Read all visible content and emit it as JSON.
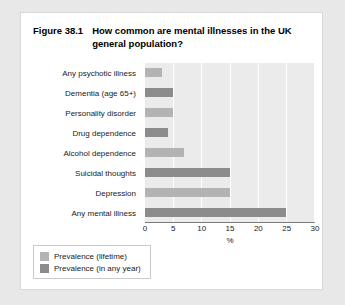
{
  "figure": {
    "number": "Figure 38.1",
    "title": "How common are mental illnesses in the UK general population?"
  },
  "colors": {
    "lifetime": "#b3b3b3",
    "any_year": "#8c8c8c",
    "plot_background": "#ebebeb",
    "gridline": "#ffffff",
    "card_background": "#ffffff",
    "page_background": "#e8e8e8"
  },
  "legend": {
    "position": "below-chart-left",
    "entries": [
      {
        "label": "Prevalence (lifetime)",
        "color": "#b3b3b3"
      },
      {
        "label": "Prevalence (in any year)",
        "color": "#8c8c8c"
      }
    ]
  },
  "chart_data": {
    "type": "bar",
    "orientation": "horizontal",
    "title": "How common are mental illnesses in the UK general population?",
    "xlabel": "%",
    "ylabel": "",
    "xlim": [
      0,
      30
    ],
    "xticks": [
      0,
      5,
      10,
      15,
      20,
      25,
      30
    ],
    "xticklabels": [
      "0",
      "5",
      "10",
      "15",
      "20",
      "25",
      "30"
    ],
    "grid": "vertical",
    "categories": [
      "Any psychotic illness",
      "Dementia (age 65+)",
      "Personality disorder",
      "Drug dependence",
      "Alcohol dependence",
      "Suicidal thoughts",
      "Depression",
      "Any mental illness"
    ],
    "values": [
      3,
      5,
      5,
      4,
      7,
      15,
      15,
      25
    ],
    "series_by_bar": [
      "Prevalence (lifetime)",
      "Prevalence (in any year)",
      "Prevalence (lifetime)",
      "Prevalence (in any year)",
      "Prevalence (lifetime)",
      "Prevalence (in any year)",
      "Prevalence (lifetime)",
      "Prevalence (in any year)"
    ],
    "bars": [
      {
        "category": "Any psychotic illness",
        "value": 3,
        "series": "Prevalence (lifetime)",
        "color": "#b3b3b3"
      },
      {
        "category": "Dementia (age 65+)",
        "value": 5,
        "series": "Prevalence (in any year)",
        "color": "#8c8c8c"
      },
      {
        "category": "Personality disorder",
        "value": 5,
        "series": "Prevalence (lifetime)",
        "color": "#b3b3b3"
      },
      {
        "category": "Drug dependence",
        "value": 4,
        "series": "Prevalence (in any year)",
        "color": "#8c8c8c"
      },
      {
        "category": "Alcohol dependence",
        "value": 7,
        "series": "Prevalence (lifetime)",
        "color": "#b3b3b3"
      },
      {
        "category": "Suicidal thoughts",
        "value": 15,
        "series": "Prevalence (in any year)",
        "color": "#8c8c8c"
      },
      {
        "category": "Depression",
        "value": 15,
        "series": "Prevalence (lifetime)",
        "color": "#b3b3b3"
      },
      {
        "category": "Any mental illness",
        "value": 25,
        "series": "Prevalence (in any year)",
        "color": "#8c8c8c"
      }
    ]
  }
}
